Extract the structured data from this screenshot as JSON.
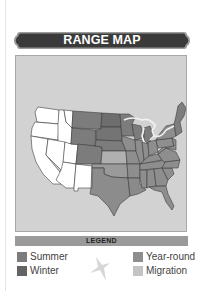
{
  "header": {
    "title": "RANGE MAP"
  },
  "map": {
    "region": "contiguous-united-states",
    "background_color": "#d2d2d2",
    "state_border_color": "#3c3c3c",
    "great_lakes_outline_color": "#f0f0f0",
    "fills": {
      "none": "#ffffff",
      "summer": "#7c7c7c",
      "winter": "#6a6a6a",
      "year_round": "#8e8e8e",
      "migration": "#b4b4b4"
    },
    "range_description": "Summer range across northern Great Plains and upper Midwest; year-round across central, southern and eastern states; migration corridor through southern plains and Texas; western states unshaded"
  },
  "legend": {
    "title": "LEGEND",
    "items": [
      {
        "key": "summer",
        "label": "Summer",
        "color": "#7c7c7c"
      },
      {
        "key": "winter",
        "label": "Winter",
        "color": "#636363"
      },
      {
        "key": "year_round",
        "label": "Year-round",
        "color": "#8e8e8e"
      },
      {
        "key": "migration",
        "label": "Migration",
        "color": "#c4c4c4"
      }
    ],
    "decoration_icon": "bird-silhouette-icon"
  }
}
